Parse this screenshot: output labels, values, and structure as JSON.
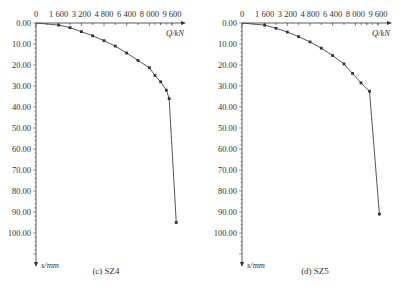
{
  "chart_data": [
    {
      "type": "line",
      "caption": "(c) SZ4",
      "xlabel": "Q/kN",
      "ylabel": "s/mm",
      "x_ticks": [
        "0",
        "1 600",
        "3 200",
        "4 800",
        "6 400",
        "8 000",
        "9 600"
      ],
      "y_ticks": [
        "0.00",
        "10.00",
        "20.00",
        "30.00",
        "40.00",
        "50.00",
        "60.00",
        "70.00",
        "80.00",
        "90.00",
        "100.00"
      ],
      "xlim": [
        0,
        9600
      ],
      "ylim": [
        0,
        100
      ],
      "y_inverted": true,
      "x_axis_position": "top",
      "grid": false,
      "series": [
        {
          "name": "SZ4",
          "x": [
            0,
            1600,
            2400,
            3200,
            4000,
            4800,
            5600,
            6400,
            7200,
            8000,
            8400,
            8800,
            9200,
            9400,
            9900
          ],
          "y": [
            0,
            1.0,
            2.2,
            4.1,
            6.1,
            8.4,
            11.0,
            14.3,
            17.8,
            21.3,
            25.0,
            28.0,
            32.0,
            36.0,
            95.0
          ]
        }
      ]
    },
    {
      "type": "line",
      "caption": "(d) SZ5",
      "xlabel": "Q/kN",
      "ylabel": "s/mm",
      "x_ticks": [
        "0",
        "1 600",
        "3 200",
        "4 800",
        "6 400",
        "8 000",
        "9 600"
      ],
      "y_ticks": [
        "0.00",
        "10.00",
        "20.00",
        "30.00",
        "40.00",
        "50.00",
        "60.00",
        "70.00",
        "80.00",
        "90.00",
        "100.00"
      ],
      "xlim": [
        0,
        9600
      ],
      "ylim": [
        0,
        100
      ],
      "y_inverted": true,
      "x_axis_position": "top",
      "grid": false,
      "series": [
        {
          "name": "SZ5",
          "x": [
            0,
            1600,
            2400,
            3200,
            4000,
            4800,
            5600,
            6400,
            7200,
            7800,
            8400,
            9000,
            9700
          ],
          "y": [
            0,
            1.0,
            2.5,
            4.3,
            6.5,
            9.0,
            12.0,
            15.5,
            19.5,
            24.0,
            28.5,
            32.5,
            91.0
          ]
        }
      ]
    }
  ]
}
